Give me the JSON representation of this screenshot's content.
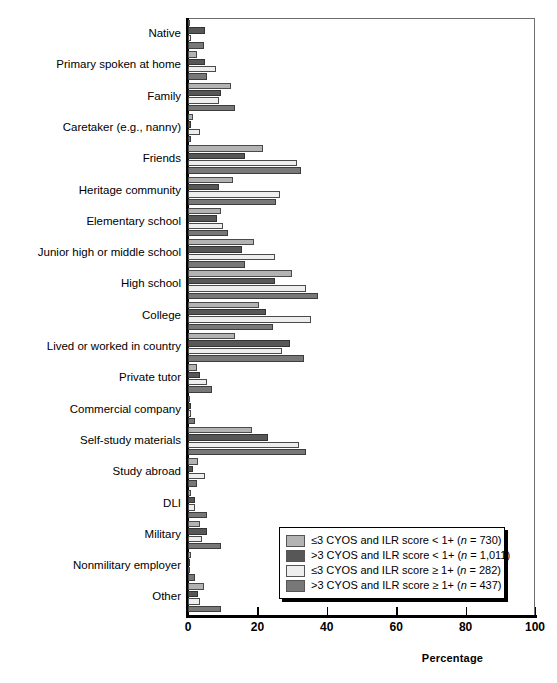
{
  "chart_data": {
    "type": "bar",
    "orientation": "horizontal",
    "title": "",
    "xlabel": "Percentage",
    "ylabel": "",
    "xlim": [
      0,
      100
    ],
    "xticks": [
      0,
      20,
      40,
      60,
      80,
      100
    ],
    "grid": false,
    "legend_position": "bottom-right",
    "categories": [
      "Native",
      "Primary spoken at home",
      "Family",
      "Caretaker (e.g., nanny)",
      "Friends",
      "Heritage community",
      "Elementary school",
      "Junior high or middle school",
      "High school",
      "College",
      "Lived or worked in country",
      "Private tutor",
      "Commercial company",
      "Self-study materials",
      "Study abroad",
      "DLI",
      "Military",
      "Nonmilitary employer",
      "Other"
    ],
    "series": [
      {
        "name": "≤3 CYOS and ILR score < 1+ (n = 730)",
        "color": "#b3b3b3",
        "values": [
          0.6,
          2.5,
          12.5,
          1.5,
          21.5,
          13.0,
          9.5,
          19.0,
          30.0,
          20.5,
          13.5,
          2.5,
          0.6,
          18.5,
          3.0,
          1.0,
          3.5,
          0.8,
          4.5
        ]
      },
      {
        "name": ">3 CYOS and ILR score < 1+ (n = 1,011)",
        "color": "#575757",
        "values": [
          5.0,
          5.0,
          9.5,
          1.0,
          16.5,
          9.0,
          8.5,
          15.5,
          25.0,
          22.5,
          29.5,
          3.5,
          1.0,
          23.0,
          1.5,
          2.0,
          5.5,
          0.6,
          3.0
        ]
      },
      {
        "name": "≤3 CYOS and ILR score ≥ 1+ (n = 282)",
        "color": "#eeeeee",
        "values": [
          1.0,
          8.0,
          9.0,
          3.5,
          31.5,
          26.5,
          10.0,
          25.0,
          34.0,
          35.5,
          27.0,
          5.5,
          1.0,
          32.0,
          5.0,
          2.0,
          4.0,
          0.5,
          3.5
        ]
      },
      {
        "name": ">3 CYOS and ILR score ≥ 1+ (n = 437)",
        "color": "#787878",
        "values": [
          4.5,
          5.5,
          13.5,
          1.0,
          32.5,
          25.5,
          11.5,
          16.5,
          37.5,
          24.5,
          33.5,
          7.0,
          2.0,
          34.0,
          2.5,
          5.5,
          9.5,
          2.0,
          9.5
        ]
      }
    ]
  },
  "axis": {
    "x_title": "Percentage",
    "tick_labels": [
      "0",
      "20",
      "40",
      "60",
      "80",
      "100"
    ]
  },
  "legend": {
    "items": [
      {
        "label": "≤3 CYOS and ILR score < 1+ (n = 730)",
        "color": "#b3b3b3"
      },
      {
        "label": ">3 CYOS and ILR score < 1+ (n = 1,011)",
        "color": "#575757"
      },
      {
        "label": "≤3 CYOS and ILR score ≥ 1+ (n = 282)",
        "color": "#eeeeee"
      },
      {
        "label": ">3 CYOS and ILR score ≥ 1+ (n = 437)",
        "color": "#787878"
      }
    ]
  }
}
